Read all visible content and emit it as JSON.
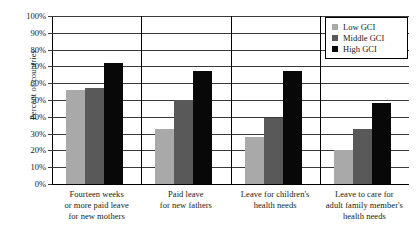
{
  "chart_data": {
    "type": "bar",
    "title": "",
    "xlabel": "",
    "ylabel": "Percent of countries",
    "ylim": [
      0,
      100
    ],
    "grid": true,
    "legend_position": "top-right",
    "categories": [
      "Fourteen weeks\nor more paid leave\nfor new mothers",
      "Paid leave\nfor new fathers",
      "Leave for children's\nhealth needs",
      "Leave to care for\nadult family member's\nhealth needs"
    ],
    "category_lines": [
      [
        "Fourteen weeks",
        "or more paid leave",
        "for new mothers"
      ],
      [
        "Paid leave",
        "for new fathers"
      ],
      [
        "Leave for children's",
        "health needs"
      ],
      [
        "Leave to care for",
        "adult family member's",
        "health needs"
      ]
    ],
    "series": [
      {
        "name": "Low GCI",
        "color": "#a9a9a9",
        "values": [
          56,
          33,
          28,
          20
        ]
      },
      {
        "name": "Middle GCI",
        "color": "#595959",
        "values": [
          57,
          50,
          39,
          33
        ]
      },
      {
        "name": "High GCI",
        "color": "#080808",
        "values": [
          72,
          67,
          67,
          48
        ]
      }
    ],
    "y_ticks": [
      {
        "value": 100,
        "label": "100%"
      },
      {
        "value": 90,
        "label": "90%"
      },
      {
        "value": 80,
        "label": "80%"
      },
      {
        "value": 70,
        "label": "70%"
      },
      {
        "value": 60,
        "label": "60%"
      },
      {
        "value": 50,
        "label": "50%"
      },
      {
        "value": 40,
        "label": "40%"
      },
      {
        "value": 30,
        "label": "30%"
      },
      {
        "value": 20,
        "label": "20%"
      },
      {
        "value": 10,
        "label": "10%"
      },
      {
        "value": 0,
        "label": "0%"
      }
    ]
  },
  "legend": {
    "items": [
      {
        "label": "Low GCI"
      },
      {
        "label": "Middle GCI"
      },
      {
        "label": "High GCI"
      }
    ]
  }
}
